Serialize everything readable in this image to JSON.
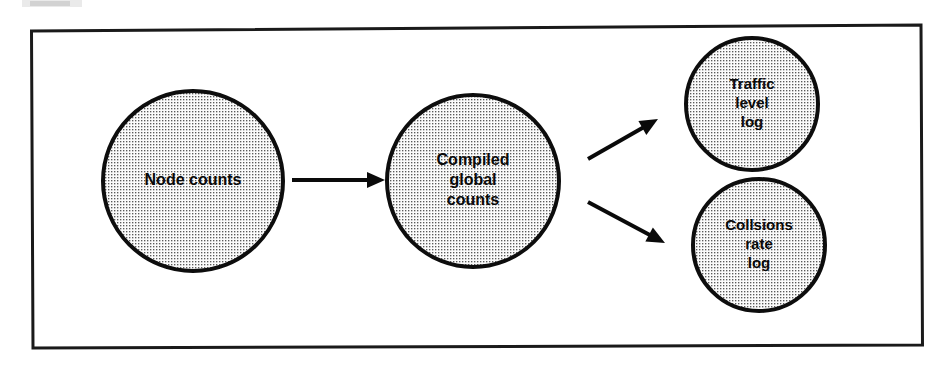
{
  "figure": {
    "kind": "flow-diagram",
    "background_color": "#ffffff",
    "ink_color": "#0a0a0a",
    "fill_pattern": "halftone-dots",
    "fill_dot_color": "#4a4a4a",
    "fill_base_color": "#fbfbfb",
    "border": {
      "name": "outer-frame",
      "stroke_color": "#1a1a1a",
      "stroke_width": 3
    }
  },
  "nodes": [
    {
      "id": "node-counts",
      "label": "Node counts",
      "lines": [
        "Node counts"
      ],
      "cx": 193,
      "cy": 181,
      "r": 90,
      "font_size": 16
    },
    {
      "id": "compiled-global-counts",
      "label": "Compiled global counts",
      "lines": [
        "Compiled",
        "global",
        "counts"
      ],
      "cx": 473,
      "cy": 181,
      "r": 86,
      "font_size": 16
    },
    {
      "id": "traffic-level-log",
      "label": "Traffic level log",
      "lines": [
        "Traffic",
        "level",
        "log"
      ],
      "cx": 752,
      "cy": 104,
      "r": 66,
      "font_size": 15
    },
    {
      "id": "collsions-rate-log",
      "label": "Collsions rate log",
      "lines": [
        "Collsions",
        "rate",
        "log"
      ],
      "cx": 759,
      "cy": 245,
      "r": 66,
      "font_size": 15
    }
  ],
  "edges": [
    {
      "id": "edge-node-to-compiled",
      "from": "node-counts",
      "to": "compiled-global-counts",
      "direction": "right",
      "x1": 292,
      "y1": 180,
      "x2": 385,
      "y2": 180
    },
    {
      "id": "edge-compiled-to-traffic",
      "from": "compiled-global-counts",
      "to": "traffic-level-log",
      "direction": "up-right",
      "x1": 588,
      "y1": 159,
      "x2": 658,
      "y2": 119
    },
    {
      "id": "edge-compiled-to-collsions",
      "from": "compiled-global-counts",
      "to": "collsions-rate-log",
      "direction": "down-right",
      "x1": 588,
      "y1": 202,
      "x2": 665,
      "y2": 243
    }
  ]
}
